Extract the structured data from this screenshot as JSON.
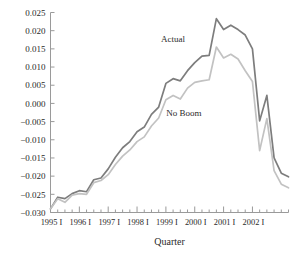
{
  "chart_data": {
    "type": "line",
    "title": "",
    "xlabel": "Quarter",
    "ylabel": "",
    "ylim": [
      -0.03,
      0.025
    ],
    "ytick_step": 0.005,
    "grid": false,
    "legend_position": "inline-annotation",
    "ytick_labels": [
      "0.025",
      "0.020",
      "0.015",
      "0.010",
      "0.005",
      "0.000",
      "−0.005",
      "−0.010",
      "−0.015",
      "−0.020",
      "−0.025",
      "−0.030"
    ],
    "ytick_values": [
      0.025,
      0.02,
      0.015,
      0.01,
      0.005,
      0.0,
      -0.005,
      -0.01,
      -0.015,
      -0.02,
      -0.025,
      -0.03
    ],
    "xtick_labels": [
      "1995 I",
      "1996 I",
      "1997 I",
      "1998 I",
      "1999 I",
      "2000 I",
      "2001 I",
      "2002 I"
    ],
    "xtick_major_index": [
      0,
      4,
      8,
      12,
      16,
      20,
      24,
      28
    ],
    "x": [
      "1995 I",
      "1995 II",
      "1995 III",
      "1995 IV",
      "1996 I",
      "1996 II",
      "1996 III",
      "1996 IV",
      "1997 I",
      "1997 II",
      "1997 III",
      "1997 IV",
      "1998 I",
      "1998 II",
      "1998 III",
      "1998 IV",
      "1999 I",
      "1999 II",
      "1999 III",
      "1999 IV",
      "2000 I",
      "2000 II",
      "2000 III",
      "2000 IV",
      "2001 I",
      "2001 II",
      "2001 III",
      "2001 IV",
      "2002 I",
      "2002 II",
      "2002 III"
    ],
    "series": [
      {
        "name": "Actual",
        "color": "#7d7d7d",
        "label_x_index": 17.0,
        "label_y_value": 0.017,
        "values": [
          -0.029,
          -0.0258,
          -0.0262,
          -0.0248,
          -0.024,
          -0.0243,
          -0.021,
          -0.0205,
          -0.018,
          -0.0148,
          -0.0122,
          -0.0105,
          -0.0078,
          -0.0065,
          -0.003,
          -0.001,
          0.0055,
          0.0068,
          0.0062,
          0.009,
          0.0112,
          0.013,
          0.0132,
          0.0233,
          0.0203,
          0.0215,
          0.0203,
          0.0188,
          0.015,
          -0.0048,
          0.0022
        ],
        "values_tail": [
          -0.015,
          -0.0192,
          -0.0202
        ]
      },
      {
        "name": "No Boom",
        "color": "#c2c2c2",
        "label_x_index": 18.5,
        "label_y_value": -0.0035,
        "values": [
          -0.029,
          -0.0262,
          -0.0272,
          -0.0252,
          -0.0248,
          -0.025,
          -0.0218,
          -0.0212,
          -0.0196,
          -0.0168,
          -0.0145,
          -0.0128,
          -0.0105,
          -0.0092,
          -0.0062,
          -0.004,
          0.001,
          0.0022,
          0.0012,
          0.0042,
          0.0058,
          0.0062,
          0.0065,
          0.0155,
          0.0125,
          0.0135,
          0.0122,
          0.009,
          0.006,
          -0.013,
          -0.0042
        ],
        "values_tail": [
          -0.0185,
          -0.0222,
          -0.0232
        ]
      }
    ],
    "annotations": [
      {
        "text": "Actual",
        "series": "Actual"
      },
      {
        "text": "No Boom",
        "series": "No Boom"
      }
    ]
  },
  "axis": {
    "x_title": "Quarter"
  }
}
